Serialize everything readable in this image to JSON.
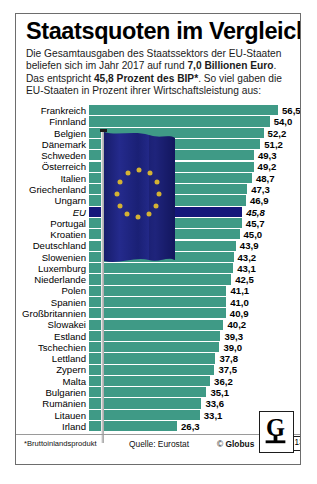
{
  "header": {
    "title": "Staatsquoten im Vergleich",
    "subtitle_parts": [
      {
        "t": "Die Gesamtausgaben des Staatssektors der EU-Staaten beliefen sich im Jahr 2017 auf rund ",
        "b": false
      },
      {
        "t": "7,0 Billionen Euro",
        "b": true
      },
      {
        "t": ". Das entspricht ",
        "b": false
      },
      {
        "t": "45,8 Prozent des BIP*",
        "b": true
      },
      {
        "t": ". So viel gaben die EU-Staaten in Prozent ihrer Wirtschaftsleistung aus:",
        "b": false
      }
    ]
  },
  "footer": {
    "footnote": "*Bruttoinlandsprodukt",
    "source": "Quelle: Eurostat",
    "copyright_prefix": "© ",
    "copyright_brand": "Globus",
    "logo_letter": "G",
    "logo_number": "13010"
  },
  "colors": {
    "bar": "#3f9a86",
    "bar_highlight": "#15177a",
    "frame": "#6d6d6d",
    "flag_blue": "#1b2079",
    "flag_star": "#d4b233"
  },
  "chart_data": {
    "type": "bar",
    "orientation": "horizontal",
    "title": "Staatsquoten im Vergleich",
    "xlabel": "",
    "ylabel": "",
    "unit": "Prozent des BIP",
    "year": 2017,
    "xlim": [
      0,
      60
    ],
    "grid": false,
    "legend": "none",
    "decimal_separator": ",",
    "highlight_category": "EU",
    "categories": [
      "Frankreich",
      "Finnland",
      "Belgien",
      "Dänemark",
      "Schweden",
      "Österreich",
      "Italien",
      "Griechenland",
      "Ungarn",
      "EU",
      "Portugal",
      "Kroatien",
      "Deutschland",
      "Slowenien",
      "Luxemburg",
      "Niederlande",
      "Polen",
      "Spanien",
      "Großbritannien",
      "Slowakei",
      "Estland",
      "Tschechien",
      "Lettland",
      "Zypern",
      "Malta",
      "Bulgarien",
      "Rumänien",
      "Litauen",
      "Irland"
    ],
    "values": [
      56.5,
      54.0,
      52.2,
      51.2,
      49.3,
      49.2,
      48.7,
      47.3,
      46.9,
      45.8,
      45.7,
      45.0,
      43.9,
      43.2,
      43.1,
      42.5,
      41.1,
      41.0,
      40.9,
      40.2,
      39.3,
      39.0,
      37.8,
      37.5,
      36.2,
      35.1,
      33.6,
      33.1,
      26.3
    ],
    "value_labels": [
      "56,5",
      "54,0",
      "52,2",
      "51,2",
      "49,3",
      "49,2",
      "48,7",
      "47,3",
      "46,9",
      "45,8",
      "45,7",
      "45,0",
      "43,9",
      "43,2",
      "43,1",
      "42,5",
      "41,1",
      "41,0",
      "40,9",
      "40,2",
      "39,3",
      "39,0",
      "37,8",
      "37,5",
      "36,2",
      "35,1",
      "33,6",
      "33,1",
      "26,3"
    ]
  }
}
